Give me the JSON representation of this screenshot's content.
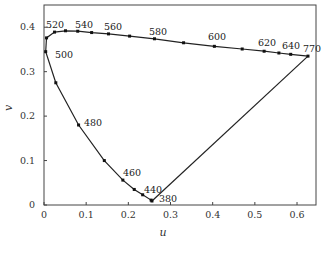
{
  "chart_data": {
    "type": "line",
    "title": "",
    "xlabel": "u",
    "ylabel": "v",
    "xlim": [
      0,
      0.645
    ],
    "ylim": [
      0,
      0.45
    ],
    "grid": false,
    "legend": null,
    "xticks": [
      "0",
      "0.1",
      "0.2",
      "0.3",
      "0.4",
      "0.5",
      "0.6"
    ],
    "yticks": [
      "0",
      "0.1",
      "0.2",
      "0.3",
      "0.4"
    ],
    "series": [
      {
        "name": "spectral locus",
        "points": [
          {
            "u": 0.256,
            "v": 0.009
          },
          {
            "u": 0.254,
            "v": 0.011
          },
          {
            "u": 0.234,
            "v": 0.023
          },
          {
            "u": 0.214,
            "v": 0.035
          },
          {
            "u": 0.187,
            "v": 0.056
          },
          {
            "u": 0.143,
            "v": 0.1
          },
          {
            "u": 0.082,
            "v": 0.18
          },
          {
            "u": 0.028,
            "v": 0.275
          },
          {
            "u": 0.004,
            "v": 0.345
          },
          {
            "u": 0.006,
            "v": 0.376
          },
          {
            "u": 0.025,
            "v": 0.389
          },
          {
            "u": 0.051,
            "v": 0.392
          },
          {
            "u": 0.08,
            "v": 0.391
          },
          {
            "u": 0.113,
            "v": 0.388
          },
          {
            "u": 0.153,
            "v": 0.385
          },
          {
            "u": 0.203,
            "v": 0.38
          },
          {
            "u": 0.262,
            "v": 0.374
          },
          {
            "u": 0.331,
            "v": 0.365
          },
          {
            "u": 0.404,
            "v": 0.357
          },
          {
            "u": 0.47,
            "v": 0.351
          },
          {
            "u": 0.522,
            "v": 0.346
          },
          {
            "u": 0.557,
            "v": 0.342
          },
          {
            "u": 0.585,
            "v": 0.339
          },
          {
            "u": 0.626,
            "v": 0.335
          }
        ]
      },
      {
        "name": "purple line",
        "points": [
          {
            "u": 0.626,
            "v": 0.335
          },
          {
            "u": 0.256,
            "v": 0.009
          }
        ]
      }
    ],
    "annotations": [
      {
        "text": "520",
        "x": 46,
        "y": 28
      },
      {
        "text": "540",
        "x": 75,
        "y": 28
      },
      {
        "text": "560",
        "x": 104,
        "y": 30
      },
      {
        "text": "580",
        "x": 149,
        "y": 35
      },
      {
        "text": "600",
        "x": 208,
        "y": 40
      },
      {
        "text": "620",
        "x": 258,
        "y": 46
      },
      {
        "text": "640",
        "x": 282,
        "y": 49
      },
      {
        "text": "770",
        "x": 303,
        "y": 52
      },
      {
        "text": "500",
        "x": 55,
        "y": 58
      },
      {
        "text": "480",
        "x": 84,
        "y": 126
      },
      {
        "text": "460",
        "x": 123,
        "y": 176
      },
      {
        "text": "440",
        "x": 144,
        "y": 193
      },
      {
        "text": "380",
        "x": 159,
        "y": 202
      }
    ]
  }
}
